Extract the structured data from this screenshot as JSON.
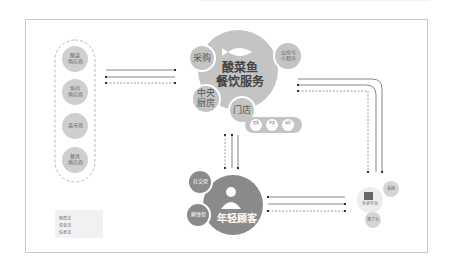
{
  "suppliers": {
    "items": [
      {
        "label_line1": "酸菜",
        "label_line2": "供应商"
      },
      {
        "label_line1": "鱼肉",
        "label_line2": "供应商"
      },
      {
        "label_line1": "菜市场",
        "label_line2": ""
      },
      {
        "label_line1": "餐具",
        "label_line2": "供应商"
      }
    ]
  },
  "service": {
    "title_line1": "酸菜鱼",
    "title_line2": "餐饮服务",
    "icon": "fish-icon",
    "satellites": {
      "purchase": "采购",
      "central_kitchen_line1": "中央",
      "central_kitchen_line2": "厨房",
      "store": "门店",
      "wechat_line1": "公众号",
      "wechat_line2": "小程序"
    },
    "store_channels": [
      "堂食",
      "外卖",
      "自提"
    ]
  },
  "customer": {
    "title": "年轻顾客",
    "icon": "person-icon",
    "types": [
      "社交型",
      "解馋型"
    ]
  },
  "platform": {
    "label": "外卖平台",
    "icon": "platform-icon",
    "partners": [
      "美团",
      "饿了么"
    ]
  },
  "legend": {
    "items": [
      {
        "label": "物质流",
        "style": "solid"
      },
      {
        "label": "资金流",
        "style": "solid"
      },
      {
        "label": "信息流",
        "style": "dashed"
      }
    ]
  },
  "colors": {
    "circle": "#c4c4c4",
    "circle_dark": "#8a8a8a",
    "line": "#555555",
    "frame": "#c8c8c8"
  }
}
